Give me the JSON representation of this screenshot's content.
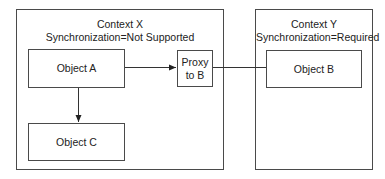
{
  "contexts": [
    {
      "id": "context-x",
      "title": "Context X",
      "subtitle": "Synchronization=Not Supported"
    },
    {
      "id": "context-y",
      "title": "Context Y",
      "subtitle": "Synchronization=Required"
    }
  ],
  "objects": {
    "a": {
      "label": "Object A"
    },
    "c": {
      "label": "Object C"
    },
    "proxy": {
      "label_line1": "Proxy",
      "label_line2": "to B"
    },
    "b": {
      "label": "Object B"
    }
  },
  "connections": [
    {
      "from": "Object A",
      "to": "Proxy to B",
      "arrow": true
    },
    {
      "from": "Object A",
      "to": "Object C",
      "arrow": true
    },
    {
      "from": "Proxy to B",
      "to": "Object B",
      "arrow": false
    }
  ],
  "colors": {
    "stroke": "#4a4a4a",
    "text": "#222222",
    "background": "#ffffff"
  }
}
